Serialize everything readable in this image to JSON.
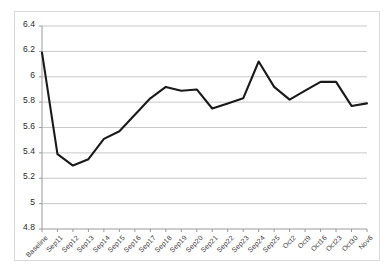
{
  "chart_data": {
    "type": "line",
    "title": "",
    "subtitle": "",
    "xlabel": "",
    "ylabel": "",
    "ylim": [
      4.8,
      6.4
    ],
    "ytick_labels": [
      "6.4",
      "6.2",
      "6",
      "5.8",
      "5.6",
      "5.4",
      "5.2",
      "5",
      "4.8"
    ],
    "ytick_values": [
      6.4,
      6.2,
      6.0,
      5.8,
      5.6,
      5.4,
      5.2,
      5.0,
      4.8
    ],
    "grid": true,
    "grid_axis": "y",
    "legend": false,
    "legend_position": "none",
    "line_color": "#1a1a1a",
    "grid_color": "#c8c8c8",
    "axis_color": "#9a9a9a",
    "background_color": "#ffffff",
    "categories": [
      "Baseline",
      "Sep11",
      "Sep12",
      "Sep13",
      "Sep14",
      "Sep15",
      "Sep16",
      "Sep17",
      "Sep18",
      "Sep19",
      "Sep20",
      "Sep21",
      "Sep22",
      "Sep23",
      "Sep24",
      "Sep25",
      "Oct2",
      "Oct9",
      "Oct16",
      "Oct23",
      "Oct30",
      "Nov6"
    ],
    "values": [
      6.19,
      5.39,
      5.3,
      5.35,
      5.51,
      5.57,
      5.7,
      5.83,
      5.92,
      5.89,
      5.9,
      5.75,
      5.79,
      5.83,
      6.12,
      5.92,
      5.82,
      5.89,
      5.96,
      5.96,
      5.77,
      5.79
    ],
    "series": [
      {
        "name": "Series 1",
        "values": [
          6.19,
          5.39,
          5.3,
          5.35,
          5.51,
          5.57,
          5.7,
          5.83,
          5.92,
          5.89,
          5.9,
          5.75,
          5.79,
          5.83,
          6.12,
          5.92,
          5.82,
          5.89,
          5.96,
          5.96,
          5.77,
          5.79
        ]
      }
    ]
  }
}
